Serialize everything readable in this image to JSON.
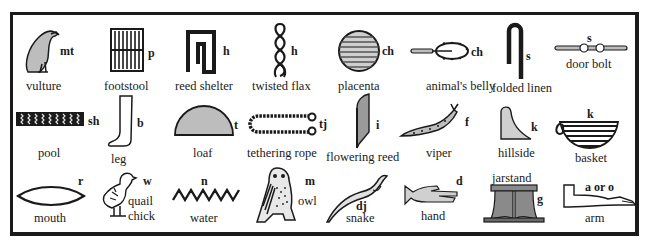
{
  "colors": {
    "ink": "#1a1a1a",
    "fill_gray": "#bdbdbd",
    "paper": "#ffffff"
  },
  "rows": [
    [
      {
        "icon": "vulture-icon",
        "sound": "mt",
        "label": "vulture"
      },
      {
        "icon": "footstool-icon",
        "sound": "p",
        "label": "footstool"
      },
      {
        "icon": "reed-shelter-icon",
        "sound": "h",
        "label": "reed shelter"
      },
      {
        "icon": "twisted-flax-icon",
        "sound": "h",
        "label": "twisted flax"
      },
      {
        "icon": "placenta-icon",
        "sound": "ch",
        "label": "placenta"
      },
      {
        "icon": "animals-belly-icon",
        "sound": "ch",
        "label": "animal's belly"
      },
      {
        "icon": "folded-linen-icon",
        "sound": "s",
        "label": "folded linen"
      },
      {
        "icon": "door-bolt-icon",
        "sound": "s",
        "label": "door bolt"
      }
    ],
    [
      {
        "icon": "pool-icon",
        "sound": "sh",
        "label": "pool"
      },
      {
        "icon": "leg-icon",
        "sound": "b",
        "label": "leg"
      },
      {
        "icon": "loaf-icon",
        "sound": "t",
        "label": "loaf"
      },
      {
        "icon": "tethering-rope-icon",
        "sound": "tj",
        "label": "tethering rope"
      },
      {
        "icon": "flowering-reed-icon",
        "sound": "i",
        "label": "flowering reed"
      },
      {
        "icon": "viper-icon",
        "sound": "f",
        "label": "viper"
      },
      {
        "icon": "hillside-icon",
        "sound": "k",
        "label": "hillside"
      },
      {
        "icon": "basket-icon",
        "sound": "k",
        "label": "basket"
      }
    ],
    [
      {
        "icon": "mouth-icon",
        "sound": "r",
        "label": "mouth"
      },
      {
        "icon": "quail-chick-icon",
        "sound": "w",
        "label": "quail chick",
        "label_line1": "quail",
        "label_line2": "chick"
      },
      {
        "icon": "water-icon",
        "sound": "n",
        "label": "water"
      },
      {
        "icon": "owl-icon",
        "sound": "m",
        "label": "owl"
      },
      {
        "icon": "snake-icon",
        "sound": "dj",
        "label": "snake"
      },
      {
        "icon": "hand-icon",
        "sound": "d",
        "label": "hand"
      },
      {
        "icon": "jarstand-icon",
        "sound": "g",
        "label": "jarstand"
      },
      {
        "icon": "arm-icon",
        "sound": "a or o",
        "label": "arm"
      }
    ]
  ]
}
